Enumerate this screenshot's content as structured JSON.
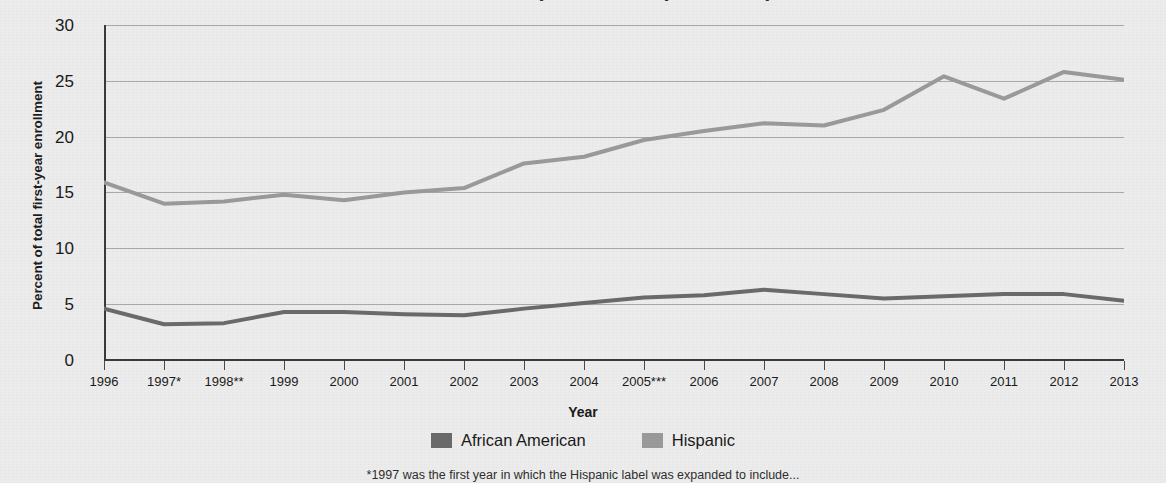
{
  "chart_data": {
    "type": "line",
    "title": "Percent of total first-year enrollment by race/ethnicity",
    "xlabel": "Year",
    "ylabel": "Percent of total first-year enrollment",
    "categories": [
      "1996",
      "1997*",
      "1998**",
      "1999",
      "2000",
      "2001",
      "2002",
      "2003",
      "2004",
      "2005***",
      "2006",
      "2007",
      "2008",
      "2009",
      "2010",
      "2011",
      "2012",
      "2013"
    ],
    "x_values": [
      1996,
      1997,
      1998,
      1999,
      2000,
      2001,
      2002,
      2003,
      2004,
      2005,
      2006,
      2007,
      2008,
      2009,
      2010,
      2011,
      2012,
      2013
    ],
    "series": [
      {
        "name": "African American",
        "color": "#6a6a6a",
        "values": [
          4.6,
          3.2,
          3.3,
          4.3,
          4.3,
          4.1,
          4.0,
          4.6,
          5.1,
          5.6,
          5.8,
          6.3,
          5.9,
          5.5,
          5.7,
          5.9,
          5.9,
          5.3
        ]
      },
      {
        "name": "Hispanic",
        "color": "#9a9a9a",
        "values": [
          15.9,
          14.0,
          14.2,
          14.8,
          14.3,
          15.0,
          15.4,
          17.6,
          18.2,
          19.7,
          20.5,
          21.2,
          21.0,
          22.4,
          25.4,
          23.4,
          25.8,
          25.1
        ]
      }
    ],
    "ylim": [
      0,
      30
    ],
    "yticks": [
      0,
      5,
      10,
      15,
      20,
      25,
      30
    ],
    "ytick_labels": [
      "0",
      "5",
      "10",
      "15",
      "20",
      "25",
      "30"
    ],
    "grid": true,
    "legend_position": "bottom"
  },
  "axis": {
    "x_title": "Year",
    "y_title": "Percent of total first-year enrollment"
  },
  "legend": {
    "items": [
      {
        "label": "African American",
        "color": "#6a6a6a"
      },
      {
        "label": "Hispanic",
        "color": "#9a9a9a"
      }
    ]
  },
  "footnote": "*1997 was the first year in which the Hispanic label was expanded to include..."
}
